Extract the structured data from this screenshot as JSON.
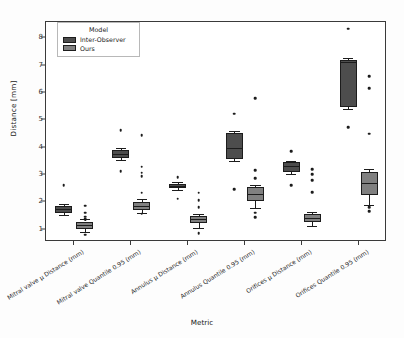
{
  "chart_data": {
    "type": "box",
    "title": "",
    "xlabel": "Metric",
    "ylabel": "Distance [mm]",
    "ylim": [
      0.55,
      8.6
    ],
    "yticks": [
      1,
      2,
      3,
      4,
      5,
      6,
      7,
      8
    ],
    "grid": false,
    "legend": {
      "title": "Model",
      "position": "upper-left",
      "entries": [
        {
          "name": "Inter-Observer",
          "color": "#4d4d4d"
        },
        {
          "name": "Ours",
          "color": "#808080"
        }
      ]
    },
    "categories": [
      "Mitral valve µ Distance (mm)",
      "Mitral valve Quantile 0.95 (mm)",
      "Annulus µ Distance (mm)",
      "Annulus Quantile 0.95 (mm)",
      "Orifices µ Distance (mm)",
      "Orifices Quantile 0.95 (mm)"
    ],
    "series": [
      {
        "name": "Inter-Observer",
        "color": "#4d4d4d",
        "boxes": [
          {
            "category": "Mitral valve µ Distance (mm)",
            "q1": 1.62,
            "median": 1.75,
            "q3": 1.88,
            "whisker_low": 1.52,
            "whisker_high": 1.95,
            "fliers": [
              2.62
            ]
          },
          {
            "category": "Mitral valve Quantile 0.95 (mm)",
            "q1": 3.62,
            "median": 3.78,
            "q3": 3.93,
            "whisker_low": 3.55,
            "whisker_high": 4.0,
            "fliers": [
              4.65,
              3.15
            ]
          },
          {
            "category": "Annulus µ Distance (mm)",
            "q1": 2.52,
            "median": 2.6,
            "q3": 2.68,
            "whisker_low": 2.45,
            "whisker_high": 2.74,
            "fliers": [
              2.92,
              2.14
            ]
          },
          {
            "category": "Annulus Quantile 0.95 (mm)",
            "q1": 3.6,
            "median": 4.0,
            "q3": 4.55,
            "whisker_low": 3.52,
            "whisker_high": 4.6,
            "fliers": [
              5.25,
              2.48
            ]
          },
          {
            "category": "Orifices µ Distance (mm)",
            "q1": 3.12,
            "median": 3.32,
            "q3": 3.46,
            "whisker_low": 3.05,
            "whisker_high": 3.52,
            "fliers": [
              3.88,
              2.62
            ]
          },
          {
            "category": "Orifices Quantile 0.95 (mm)",
            "q1": 5.48,
            "median": 7.12,
            "q3": 7.22,
            "whisker_low": 5.4,
            "whisker_high": 7.28,
            "fliers": [
              8.35,
              4.75
            ]
          }
        ]
      },
      {
        "name": "Ours",
        "color": "#808080",
        "boxes": [
          {
            "category": "Mitral valve µ Distance (mm)",
            "q1": 1.02,
            "median": 1.18,
            "q3": 1.3,
            "whisker_low": 0.92,
            "whisker_high": 1.38,
            "fliers": [
              1.88,
              1.62,
              1.48,
              1.38,
              0.82
            ]
          },
          {
            "category": "Mitral valve Quantile 0.95 (mm)",
            "q1": 1.72,
            "median": 1.88,
            "q3": 2.02,
            "whisker_low": 1.62,
            "whisker_high": 2.12,
            "fliers": [
              4.45,
              3.3,
              3.08,
              2.95,
              2.35,
              1.58
            ]
          },
          {
            "category": "Annulus µ Distance (mm)",
            "q1": 1.25,
            "median": 1.38,
            "q3": 1.5,
            "whisker_low": 1.08,
            "whisker_high": 1.58,
            "fliers": [
              2.35,
              2.08,
              1.82,
              0.88
            ]
          },
          {
            "category": "Annulus Quantile 0.95 (mm)",
            "q1": 2.05,
            "median": 2.32,
            "q3": 2.55,
            "whisker_low": 1.78,
            "whisker_high": 2.65,
            "fliers": [
              5.82,
              3.18,
              2.88,
              1.62,
              1.45
            ]
          },
          {
            "category": "Orifices µ Distance (mm)",
            "q1": 1.28,
            "median": 1.42,
            "q3": 1.56,
            "whisker_low": 1.15,
            "whisker_high": 1.66,
            "fliers": [
              3.22,
              3.02,
              2.82,
              2.38
            ]
          },
          {
            "category": "Orifices Quantile 0.95 (mm)",
            "q1": 2.28,
            "median": 2.72,
            "q3": 3.12,
            "whisker_low": 1.92,
            "whisker_high": 3.22,
            "fliers": [
              6.62,
              6.18,
              4.52,
              1.82,
              1.68
            ]
          }
        ]
      }
    ]
  }
}
